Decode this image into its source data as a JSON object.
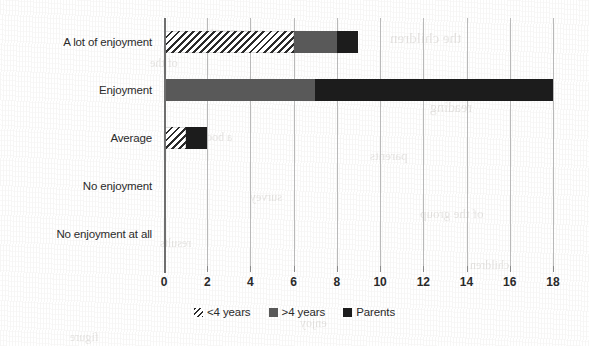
{
  "chart_data": {
    "type": "bar",
    "orientation": "horizontal",
    "stacked": true,
    "title": "",
    "xlabel": "",
    "ylabel": "",
    "categories": [
      "A lot of enjoyment",
      "Enjoyment",
      "Average",
      "No enjoyment",
      "No enjoyment at all"
    ],
    "series": [
      {
        "name": "<4 years",
        "values": [
          6,
          0,
          1,
          0,
          0
        ],
        "fill": "hatch"
      },
      {
        "name": ">4 years",
        "values": [
          2,
          7,
          0,
          0,
          0
        ],
        "fill": "gray"
      },
      {
        "name": "Parents",
        "values": [
          1,
          11,
          1,
          0,
          0
        ],
        "fill": "black"
      }
    ],
    "xlim": [
      0,
      18
    ],
    "xticks": [
      0,
      2,
      4,
      6,
      8,
      10,
      12,
      14,
      16,
      18
    ],
    "xtick_labels": [
      "0",
      "2",
      "4",
      "6",
      "8",
      "10",
      "12",
      "14",
      "16",
      "18"
    ],
    "grid": true,
    "grid_axis": "x",
    "legend_position": "bottom-center",
    "colors": {
      "hatch_line": "#2b2b2b",
      "gray": "#595959",
      "black": "#1c1c1c",
      "gridline": "#b9b9b9",
      "axis": "#6f6f6f",
      "text": "#2a2a2a",
      "background": "#ffffff"
    }
  },
  "legend": {
    "items": [
      {
        "label": "<4 years",
        "swatch": "hatch-swatch-icon"
      },
      {
        "label": ">4 years",
        "swatch": "gray-swatch-icon"
      },
      {
        "label": "Parents",
        "swatch": "black-swatch-icon"
      }
    ]
  },
  "bleed_through": [
    {
      "text": "enjoyment",
      "x": 210,
      "y": 24,
      "size": 13
    },
    {
      "text": "the children",
      "x": 390,
      "y": 30,
      "size": 15
    },
    {
      "text": "of the",
      "x": 150,
      "y": 56,
      "size": 12
    },
    {
      "text": "reading",
      "x": 430,
      "y": 100,
      "size": 14
    },
    {
      "text": "a book",
      "x": 200,
      "y": 130,
      "size": 12
    },
    {
      "text": "parents",
      "x": 370,
      "y": 148,
      "size": 13
    },
    {
      "text": "survey",
      "x": 250,
      "y": 190,
      "size": 12
    },
    {
      "text": "of the group",
      "x": 420,
      "y": 206,
      "size": 13
    },
    {
      "text": "results",
      "x": 160,
      "y": 236,
      "size": 12
    },
    {
      "text": "children",
      "x": 470,
      "y": 258,
      "size": 12
    },
    {
      "text": "enjoy",
      "x": 300,
      "y": 316,
      "size": 12
    },
    {
      "text": "figure",
      "x": 70,
      "y": 330,
      "size": 12
    }
  ]
}
